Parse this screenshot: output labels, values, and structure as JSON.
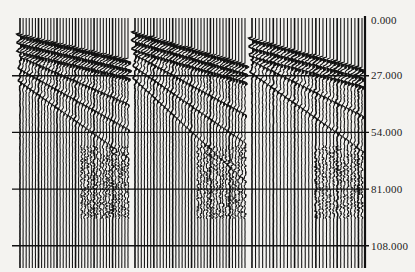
{
  "chart_data": {
    "type": "seismic-wiggle",
    "title": "",
    "xlabel": "",
    "ylabel": "",
    "y_axis_position": "right",
    "y_tick_labels": [
      "0.000",
      "27.000",
      "54.000",
      "81.000",
      "108.000"
    ],
    "y_ticks": [
      0,
      27,
      54,
      81,
      108
    ],
    "ylim": [
      0,
      112
    ],
    "y_inverted": true,
    "grid": {
      "horizontal_lines": true,
      "at": [
        27,
        54,
        81,
        108
      ]
    },
    "panels": [
      {
        "name": "gather-1",
        "trace_count": 36,
        "first_arrival_start": 8,
        "first_arrival_end": 20,
        "event_slopes": [
          0.35,
          0.55,
          0.8
        ]
      },
      {
        "name": "gather-2",
        "trace_count": 36,
        "first_arrival_start": 7,
        "first_arrival_end": 22,
        "event_slopes": [
          0.45,
          0.7,
          1.1
        ]
      },
      {
        "name": "gather-3",
        "trace_count": 32,
        "first_arrival_start": 10,
        "first_arrival_end": 24,
        "event_slopes": [
          0.4,
          0.75
        ]
      }
    ]
  },
  "colors": {
    "ink": "#111111",
    "background": "#f4f3f0"
  }
}
